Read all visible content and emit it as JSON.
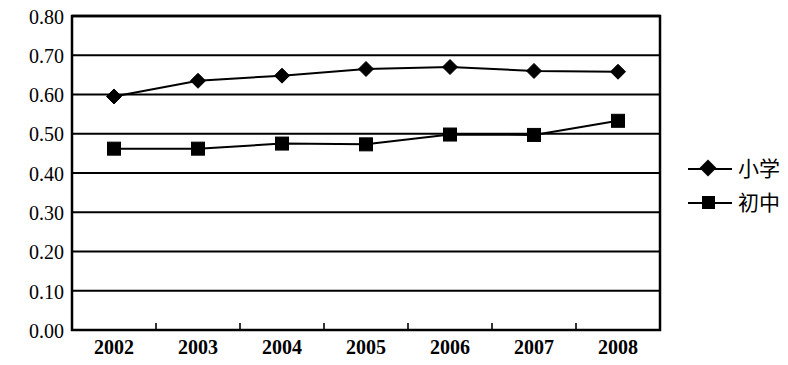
{
  "chart_data": {
    "type": "line",
    "title": "",
    "subtitle": "",
    "xlabel": "",
    "ylabel": "",
    "categories": [
      "2002",
      "2003",
      "2004",
      "2005",
      "2006",
      "2007",
      "2008"
    ],
    "series": [
      {
        "name": "小学",
        "marker": "diamond",
        "color": "#000000",
        "values": [
          0.595,
          0.635,
          0.648,
          0.665,
          0.67,
          0.66,
          0.658
        ]
      },
      {
        "name": "初中",
        "marker": "square",
        "color": "#000000",
        "values": [
          0.462,
          0.462,
          0.475,
          0.473,
          0.498,
          0.497,
          0.533
        ]
      }
    ],
    "ylim": [
      0.0,
      0.8
    ],
    "y_ticks": [
      "0.00",
      "0.10",
      "0.20",
      "0.30",
      "0.40",
      "0.50",
      "0.60",
      "0.70",
      "0.80"
    ],
    "y_tick_values": [
      0.0,
      0.1,
      0.2,
      0.3,
      0.4,
      0.5,
      0.6,
      0.7,
      0.8
    ],
    "x_ticks": [
      "2002",
      "2003",
      "2004",
      "2005",
      "2006",
      "2007",
      "2008"
    ],
    "grid": "horizontal",
    "grid_color": "#000000",
    "legend_position": "right",
    "plot_background": "#ffffff",
    "border_color": "#000000"
  },
  "legend": {
    "items": [
      {
        "label": "小学",
        "marker": "diamond"
      },
      {
        "label": "初中",
        "marker": "square"
      }
    ]
  },
  "axis": {
    "y_labels": [
      "0.80",
      "0.70",
      "0.60",
      "0.50",
      "0.40",
      "0.30",
      "0.20",
      "0.10",
      "0.00"
    ],
    "x_labels": [
      "2002",
      "2003",
      "2004",
      "2005",
      "2006",
      "2007",
      "2008"
    ]
  }
}
